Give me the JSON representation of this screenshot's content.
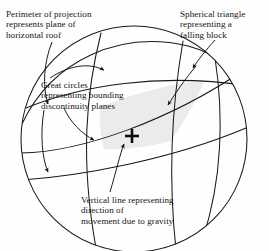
{
  "figure": {
    "type": "stereographic-projection-diagram",
    "background_color": "#fefefe",
    "line_color": "#1a1a1a",
    "shaded_region_color": "#ebebeb"
  },
  "annotations": {
    "perimeter": {
      "name": "perimeter-of-projection",
      "lines": [
        "Perimeter of projection",
        "represents plane of",
        "horizontal roof"
      ]
    },
    "spherical_triangle": {
      "name": "spherical-triangle",
      "lines": [
        "Spherical triangle",
        "representing a",
        "falling block"
      ]
    },
    "great_circles": {
      "name": "great-circles",
      "lines": [
        "Great circles",
        "representing bounding",
        "discontinuity planes"
      ]
    },
    "vertical_line": {
      "name": "vertical-line",
      "lines": [
        "Vertical line representing",
        "direction of",
        "movement due to gravity"
      ]
    }
  },
  "geometry": {
    "primitive_circle": {
      "cx": 134,
      "cy": 139,
      "r": 113
    },
    "centre_marker": {
      "symbol": "plus",
      "x": 132,
      "y": 136,
      "arm": 7
    },
    "great_circle_count": 6
  }
}
